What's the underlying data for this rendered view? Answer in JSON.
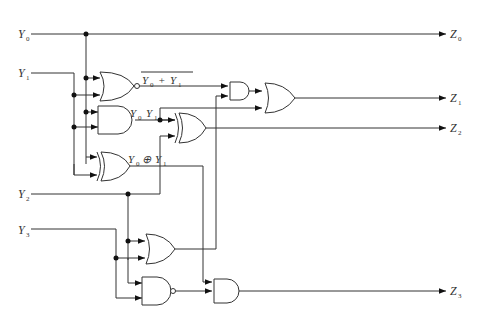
{
  "diagram": {
    "type": "combinational-logic-circuit",
    "inputs": [
      {
        "id": "Y0",
        "base": "Y",
        "sub": "0"
      },
      {
        "id": "Y1",
        "base": "Y",
        "sub": "1"
      },
      {
        "id": "Y2",
        "base": "Y",
        "sub": "2"
      },
      {
        "id": "Y3",
        "base": "Y",
        "sub": "3"
      }
    ],
    "outputs": [
      {
        "id": "Z0",
        "base": "Z",
        "sub": "0"
      },
      {
        "id": "Z1",
        "base": "Z",
        "sub": "1"
      },
      {
        "id": "Z2",
        "base": "Z",
        "sub": "2"
      },
      {
        "id": "Z3",
        "base": "Z",
        "sub": "3"
      }
    ],
    "annotations": {
      "nor_expr": {
        "a": "Y",
        "a_sub": "0",
        "op": "+",
        "b": "Y",
        "b_sub": "1",
        "overline": true
      },
      "and_expr": {
        "a": "Y",
        "a_sub": "0",
        "b": "Y",
        "b_sub": "1"
      },
      "xor_expr": {
        "a": "Y",
        "a_sub": "0",
        "op": "⊕",
        "b": "Y",
        "b_sub": "1"
      }
    },
    "gates": [
      {
        "id": "G1",
        "kind": "NOR",
        "inputs": [
          "Y0",
          "Y1"
        ]
      },
      {
        "id": "G2",
        "kind": "AND",
        "inputs": [
          "Y0",
          "Y1"
        ]
      },
      {
        "id": "G3",
        "kind": "XOR",
        "inputs": [
          "Y0",
          "Y1"
        ]
      },
      {
        "id": "G4",
        "kind": "XOR",
        "inputs": [
          "G2",
          "Y2"
        ],
        "output": "Z2"
      },
      {
        "id": "G5",
        "kind": "AND",
        "inputs": [
          "G1",
          "G6"
        ]
      },
      {
        "id": "G6",
        "kind": "OR",
        "inputs": [
          "Y2",
          "Y3"
        ]
      },
      {
        "id": "G7",
        "kind": "OR",
        "inputs": [
          "G5",
          "G2"
        ],
        "output": "Z1"
      },
      {
        "id": "G8",
        "kind": "NAND",
        "inputs": [
          "Y2",
          "Y3"
        ]
      },
      {
        "id": "G9",
        "kind": "AND",
        "inputs": [
          "G3",
          "G8"
        ],
        "output": "Z3"
      }
    ],
    "direct": [
      {
        "from": "Y0",
        "to": "Z0"
      }
    ]
  }
}
